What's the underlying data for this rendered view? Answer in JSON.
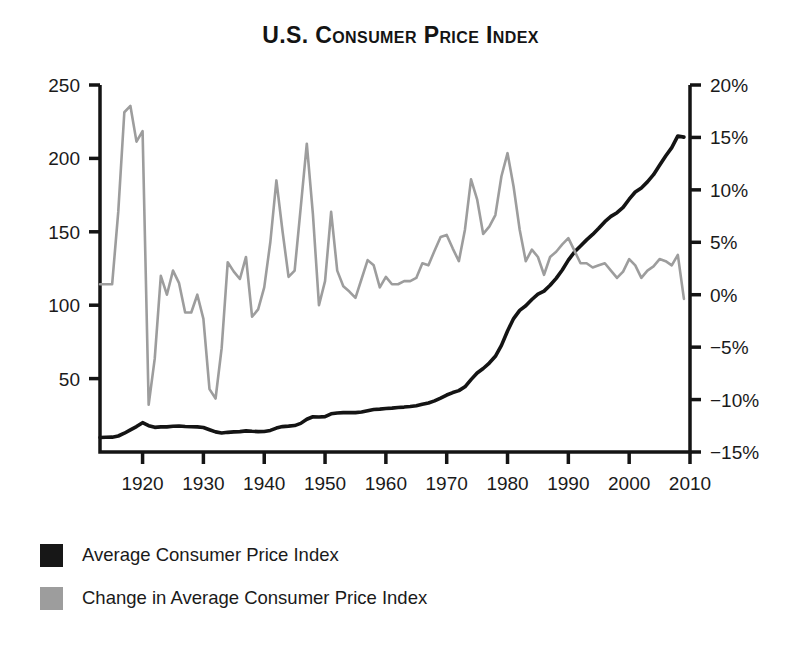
{
  "chart_data": {
    "type": "line",
    "title": "U.S. Consumer Price Index",
    "xlabel": "",
    "ylabel": "",
    "ylabel_right": "",
    "grid": false,
    "legend_position": "below-left",
    "xlim": [
      1913,
      2010
    ],
    "ylim": [
      0,
      250
    ],
    "ylim_right": [
      -15,
      20
    ],
    "xticks": [
      1920,
      1930,
      1940,
      1950,
      1960,
      1970,
      1980,
      1990,
      2000,
      2010
    ],
    "xticklabels": [
      "1920",
      "1930",
      "1940",
      "1950",
      "1960",
      "1970",
      "1980",
      "1990",
      "2000",
      "2010"
    ],
    "yticks_left": [
      50,
      100,
      150,
      200,
      250
    ],
    "yticklabels_left": [
      "50",
      "100",
      "150",
      "200",
      "250"
    ],
    "yticks_right": [
      -15,
      -10,
      -5,
      0,
      5,
      10,
      15,
      20
    ],
    "yticklabels_right": [
      "−15%",
      "−10%",
      "−5%",
      "0%",
      "5%",
      "10%",
      "15%",
      "20%"
    ],
    "x": [
      1913,
      1914,
      1915,
      1916,
      1917,
      1918,
      1919,
      1920,
      1921,
      1922,
      1923,
      1924,
      1925,
      1926,
      1927,
      1928,
      1929,
      1930,
      1931,
      1932,
      1933,
      1934,
      1935,
      1936,
      1937,
      1938,
      1939,
      1940,
      1941,
      1942,
      1943,
      1944,
      1945,
      1946,
      1947,
      1948,
      1949,
      1950,
      1951,
      1952,
      1953,
      1954,
      1955,
      1956,
      1957,
      1958,
      1959,
      1960,
      1961,
      1962,
      1963,
      1964,
      1965,
      1966,
      1967,
      1968,
      1969,
      1970,
      1971,
      1972,
      1973,
      1974,
      1975,
      1976,
      1977,
      1978,
      1979,
      1980,
      1981,
      1982,
      1983,
      1984,
      1985,
      1986,
      1987,
      1988,
      1989,
      1990,
      1991,
      1992,
      1993,
      1994,
      1995,
      1996,
      1997,
      1998,
      1999,
      2000,
      2001,
      2002,
      2003,
      2004,
      2005,
      2006,
      2007,
      2008,
      2009
    ],
    "series": [
      {
        "name": "Average Consumer Price Index",
        "axis": "left",
        "color": "#141414",
        "values": [
          9.9,
          10.0,
          10.1,
          10.9,
          12.8,
          15.1,
          17.3,
          20.0,
          17.9,
          16.8,
          17.1,
          17.1,
          17.5,
          17.7,
          17.4,
          17.2,
          17.1,
          16.7,
          15.2,
          13.7,
          13.0,
          13.4,
          13.7,
          13.9,
          14.4,
          14.1,
          13.9,
          14.0,
          14.7,
          16.3,
          17.3,
          17.6,
          18.0,
          19.5,
          22.3,
          24.0,
          23.8,
          24.1,
          26.0,
          26.6,
          26.8,
          26.9,
          26.8,
          27.2,
          28.1,
          28.9,
          29.2,
          29.6,
          29.9,
          30.3,
          30.6,
          31.0,
          31.5,
          32.5,
          33.4,
          34.8,
          36.7,
          38.8,
          40.5,
          41.8,
          44.4,
          49.3,
          53.8,
          56.9,
          60.6,
          65.2,
          72.6,
          82.4,
          90.9,
          96.5,
          99.6,
          103.9,
          107.6,
          109.6,
          113.6,
          118.3,
          124.0,
          130.7,
          136.2,
          140.3,
          144.5,
          148.2,
          152.4,
          156.9,
          160.5,
          163.0,
          166.6,
          172.2,
          177.1,
          179.9,
          184.0,
          188.9,
          195.3,
          201.6,
          207.3,
          215.3,
          214.5
        ]
      },
      {
        "name": "Change in Average Consumer Price Index",
        "axis": "right",
        "color": "#9d9d9d",
        "units": "percent",
        "values": [
          1.0,
          1.0,
          1.0,
          7.9,
          17.4,
          18.0,
          14.6,
          15.6,
          -10.5,
          -6.1,
          1.8,
          0.0,
          2.3,
          1.1,
          -1.7,
          -1.7,
          0.0,
          -2.3,
          -9.0,
          -9.9,
          -5.1,
          3.1,
          2.2,
          1.5,
          3.6,
          -2.1,
          -1.4,
          0.7,
          5.0,
          10.9,
          6.1,
          1.7,
          2.3,
          8.3,
          14.4,
          7.7,
          -1.0,
          1.3,
          7.9,
          2.3,
          0.8,
          0.3,
          -0.3,
          1.5,
          3.3,
          2.8,
          0.7,
          1.7,
          1.0,
          1.0,
          1.3,
          1.3,
          1.6,
          3.0,
          2.8,
          4.2,
          5.5,
          5.7,
          4.4,
          3.2,
          6.2,
          11.0,
          9.1,
          5.8,
          6.5,
          7.6,
          11.3,
          13.5,
          10.3,
          6.2,
          3.2,
          4.3,
          3.6,
          1.9,
          3.6,
          4.1,
          4.8,
          5.4,
          4.2,
          3.0,
          3.0,
          2.6,
          2.8,
          3.0,
          2.3,
          1.6,
          2.2,
          3.4,
          2.8,
          1.6,
          2.3,
          2.7,
          3.4,
          3.2,
          2.8,
          3.8,
          -0.4
        ]
      }
    ]
  },
  "legend": [
    {
      "label": "Average Consumer Price Index",
      "color": "#171717",
      "swatch": "black-swatch"
    },
    {
      "label": "Change in Average Consumer Price Index",
      "color": "#9d9d9d",
      "swatch": "gray-swatch"
    }
  ]
}
